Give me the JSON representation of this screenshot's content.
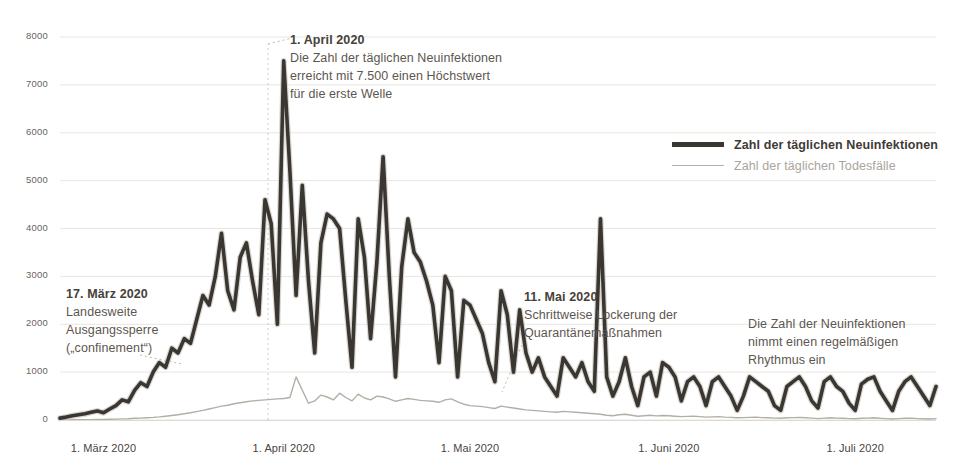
{
  "chart_data": {
    "type": "line",
    "title": "",
    "xlabel": "",
    "ylabel": "",
    "ylim": [
      0,
      8000
    ],
    "grid": true,
    "legend_position": "right-top",
    "y_ticks": [
      "0",
      "1000",
      "2000",
      "3000",
      "4000",
      "5000",
      "6000",
      "7000",
      "8000"
    ],
    "x_ticks": [
      "1. März 2020",
      "1. April 2020",
      "1. Mai 2020",
      "1. Juni 2020",
      "1. Juli 2020"
    ],
    "x_tick_dates": [
      "2020-03-01",
      "2020-04-01",
      "2020-05-01",
      "2020-06-01",
      "2020-07-01"
    ],
    "x_range": [
      "2020-02-25",
      "2020-07-11"
    ],
    "series": [
      {
        "name": "Zahl der täglichen Neuinfektionen",
        "color": "#3a3732",
        "values": [
          40,
          60,
          90,
          110,
          130,
          160,
          190,
          150,
          230,
          300,
          420,
          380,
          620,
          780,
          700,
          1000,
          1200,
          1100,
          1500,
          1400,
          1700,
          1600,
          2100,
          2600,
          2400,
          3000,
          3900,
          2700,
          2300,
          3400,
          3700,
          2900,
          2200,
          4600,
          4100,
          2000,
          7500,
          5200,
          2600,
          4900,
          2900,
          1400,
          3700,
          4300,
          4200,
          4000,
          2500,
          1100,
          4200,
          3400,
          1700,
          3300,
          5500,
          3000,
          900,
          3200,
          4200,
          3500,
          3300,
          2900,
          2400,
          1200,
          3000,
          2700,
          900,
          2500,
          2400,
          2100,
          1800,
          1200,
          800,
          2700,
          2200,
          1000,
          2300,
          1400,
          1000,
          1300,
          900,
          700,
          500,
          1300,
          1100,
          900,
          1200,
          800,
          600,
          4200,
          900,
          500,
          800,
          1300,
          700,
          300,
          900,
          1000,
          500,
          1200,
          1100,
          900,
          400,
          800,
          900,
          700,
          300,
          800,
          900,
          700,
          500,
          200,
          500,
          900,
          800,
          700,
          600,
          300,
          200,
          700,
          800,
          900,
          700,
          400,
          250,
          800,
          900,
          700,
          600,
          350,
          200,
          750,
          850,
          900,
          600,
          400,
          200,
          600,
          800,
          900,
          700,
          500,
          300,
          700
        ]
      },
      {
        "name": "Zahl der täglichen Todesfälle",
        "color": "#b3aea6",
        "values": [
          2,
          3,
          4,
          5,
          6,
          8,
          10,
          12,
          15,
          18,
          22,
          28,
          35,
          40,
          48,
          55,
          65,
          80,
          95,
          110,
          130,
          150,
          175,
          200,
          230,
          260,
          290,
          310,
          340,
          360,
          380,
          400,
          410,
          420,
          430,
          440,
          450,
          470,
          900,
          620,
          350,
          400,
          520,
          480,
          420,
          560,
          470,
          400,
          540,
          460,
          420,
          500,
          480,
          440,
          390,
          420,
          450,
          430,
          410,
          400,
          390,
          370,
          420,
          440,
          380,
          330,
          300,
          290,
          280,
          260,
          240,
          290,
          270,
          250,
          230,
          210,
          200,
          190,
          180,
          170,
          160,
          180,
          170,
          160,
          150,
          140,
          130,
          120,
          100,
          90,
          110,
          120,
          100,
          80,
          90,
          100,
          85,
          95,
          90,
          80,
          70,
          75,
          80,
          70,
          60,
          65,
          70,
          60,
          55,
          45,
          50,
          55,
          60,
          50,
          45,
          40,
          35,
          45,
          50,
          55,
          45,
          40,
          30,
          40,
          45,
          40,
          35,
          30,
          25,
          35,
          40,
          45,
          35,
          30,
          20,
          30,
          35,
          40,
          30,
          25,
          20,
          30
        ]
      }
    ],
    "annotations": [
      {
        "id": "april",
        "heading": "1. April 2020",
        "lines": [
          "Die Zahl der täglichen Neuinfektionen",
          "erreicht mit 7.500 einen Höchstwert",
          "für die erste Welle"
        ]
      },
      {
        "id": "maerz",
        "heading": "17. März 2020",
        "lines": [
          "Landesweite",
          "Ausgangssperre",
          "(„confinement“)"
        ]
      },
      {
        "id": "mai",
        "heading": "11. Mai 2020",
        "lines": [
          "Schrittweise Lockerung der",
          "Quarantänemaßnahmen"
        ]
      },
      {
        "id": "rhythmus",
        "heading": "",
        "lines": [
          "Die Zahl der Neuinfektionen",
          "nimmt einen regelmäßigen",
          "Rhythmus ein"
        ]
      }
    ]
  },
  "legend": {
    "items": [
      {
        "label": "Zahl der täglichen Neuinfektionen",
        "color": "#3a3732"
      },
      {
        "label": "Zahl der täglichen Todesfälle",
        "color": "#b3aea6"
      }
    ]
  },
  "colors": {
    "background": "#ffffff",
    "grid": "#e9e6e1",
    "axis_text": "#58524c",
    "cases": "#3a3732",
    "deaths": "#b3aea6",
    "leader": "#b8b3ab"
  }
}
